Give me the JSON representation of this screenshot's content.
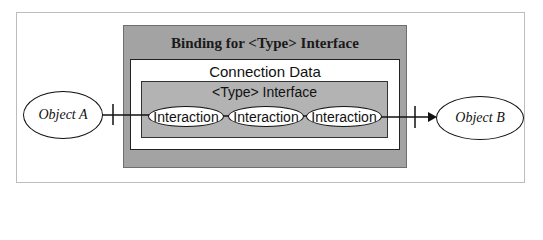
{
  "diagram": {
    "binding_title": "Binding for <Type> Interface",
    "connection_title": "Connection Data",
    "interface_title": "<Type> Interface",
    "interactions": [
      "Interaction",
      "Interaction",
      "Interaction"
    ],
    "object_a": "Object A",
    "object_b": "Object B",
    "colors": {
      "binding_fill": "#a3a3a3",
      "interface_fill": "#b3b3b3",
      "connection_fill": "#ffffff"
    }
  }
}
